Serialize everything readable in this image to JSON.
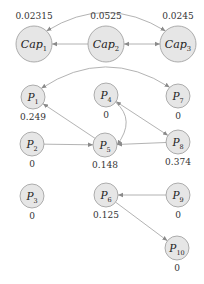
{
  "diagram": {
    "title": "",
    "colors": {
      "node_fill": "#e6e6e6",
      "node_stroke": "#9a9a9a",
      "edge": "#a0a0a0",
      "text": "#222222"
    },
    "nodes": [
      {
        "id": "Cap1",
        "base": "Cap",
        "sub": "1",
        "value": "0.02315",
        "x": 34,
        "y": 44,
        "r": 18,
        "value_pos": "above"
      },
      {
        "id": "Cap2",
        "base": "Cap",
        "sub": "2",
        "value": "0.0525",
        "x": 106,
        "y": 44,
        "r": 18,
        "value_pos": "above"
      },
      {
        "id": "Cap3",
        "base": "Cap",
        "sub": "3",
        "value": "0.0245",
        "x": 178,
        "y": 44,
        "r": 18,
        "value_pos": "above"
      },
      {
        "id": "P1",
        "base": "P",
        "sub": "1",
        "value": "0.249",
        "x": 33,
        "y": 97,
        "r": 12,
        "value_pos": "below"
      },
      {
        "id": "P4",
        "base": "P",
        "sub": "4",
        "value": "0",
        "x": 106,
        "y": 95,
        "r": 12,
        "value_pos": "below"
      },
      {
        "id": "P7",
        "base": "P",
        "sub": "7",
        "value": "0",
        "x": 178,
        "y": 96,
        "r": 12,
        "value_pos": "below"
      },
      {
        "id": "P2",
        "base": "P",
        "sub": "2",
        "value": "0",
        "x": 32,
        "y": 144,
        "r": 12,
        "value_pos": "below"
      },
      {
        "id": "P5",
        "base": "P",
        "sub": "5",
        "value": "0.148",
        "x": 105,
        "y": 145,
        "r": 12,
        "value_pos": "below"
      },
      {
        "id": "P8",
        "base": "P",
        "sub": "8",
        "value": "0.374",
        "x": 178,
        "y": 142,
        "r": 12,
        "value_pos": "below"
      },
      {
        "id": "P3",
        "base": "P",
        "sub": "3",
        "value": "0",
        "x": 32,
        "y": 196,
        "r": 12,
        "value_pos": "below"
      },
      {
        "id": "P6",
        "base": "P",
        "sub": "6",
        "value": "0.125",
        "x": 106,
        "y": 195,
        "r": 12,
        "value_pos": "below"
      },
      {
        "id": "P9",
        "base": "P",
        "sub": "9",
        "value": "0",
        "x": 178,
        "y": 195,
        "r": 12,
        "value_pos": "below"
      },
      {
        "id": "P10",
        "base": "P",
        "sub": "10",
        "value": "0",
        "x": 177,
        "y": 248,
        "r": 12,
        "value_pos": "below"
      }
    ],
    "edges": [
      {
        "from": "Cap2",
        "to": "Cap1",
        "type": "straight",
        "arrow_end": true,
        "arrow_start": false
      },
      {
        "from": "Cap2",
        "to": "Cap3",
        "type": "straight",
        "arrow_end": true,
        "arrow_start": true
      },
      {
        "from": "Cap1",
        "to": "Cap3",
        "type": "curve",
        "arrow_end": true,
        "arrow_start": true
      },
      {
        "from": "P1",
        "to": "P7",
        "type": "curve",
        "arrow_end": true,
        "arrow_start": true
      },
      {
        "from": "P5",
        "to": "P1",
        "type": "straight",
        "arrow_end": true,
        "arrow_start": false
      },
      {
        "from": "P2",
        "to": "P5",
        "type": "straight",
        "arrow_end": true,
        "arrow_start": false
      },
      {
        "from": "P4",
        "to": "P5",
        "type": "curve",
        "arrow_end": true,
        "arrow_start": false
      },
      {
        "from": "P4",
        "to": "P8",
        "type": "straight",
        "arrow_end": true,
        "arrow_start": true
      },
      {
        "from": "P8",
        "to": "P5",
        "type": "straight",
        "arrow_end": true,
        "arrow_start": false
      },
      {
        "from": "P9",
        "to": "P6",
        "type": "straight",
        "arrow_end": true,
        "arrow_start": false
      },
      {
        "from": "P6",
        "to": "P10",
        "type": "straight",
        "arrow_end": true,
        "arrow_start": false
      }
    ]
  }
}
